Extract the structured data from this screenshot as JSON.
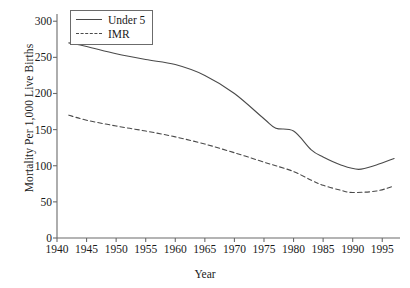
{
  "chart_data": {
    "type": "line",
    "title": "",
    "xlabel": "Year",
    "ylabel": "Mortality Per 1,000 Live Births",
    "xlim": [
      1940,
      1998
    ],
    "ylim": [
      0,
      310
    ],
    "xticks": [
      1940,
      1945,
      1950,
      1955,
      1960,
      1965,
      1970,
      1975,
      1980,
      1985,
      1990,
      1995
    ],
    "yticks": [
      0,
      50,
      100,
      150,
      200,
      250,
      300
    ],
    "grid": false,
    "legend_position": "top-left",
    "series": [
      {
        "name": "Under 5",
        "style": "solid",
        "color": "#4a4a4a",
        "x": [
          1942,
          1945,
          1950,
          1955,
          1960,
          1965,
          1970,
          1975,
          1977,
          1980,
          1983,
          1985,
          1988,
          1991,
          1994,
          1997
        ],
        "values": [
          270,
          265,
          255,
          247,
          240,
          225,
          200,
          165,
          152,
          148,
          122,
          112,
          101,
          95,
          101,
          110
        ]
      },
      {
        "name": "IMR",
        "style": "dashed",
        "color": "#4a4a4a",
        "x": [
          1942,
          1945,
          1950,
          1955,
          1960,
          1965,
          1970,
          1975,
          1977,
          1980,
          1983,
          1985,
          1988,
          1990,
          1994,
          1997
        ],
        "values": [
          170,
          163,
          155,
          148,
          140,
          130,
          118,
          105,
          100,
          92,
          80,
          73,
          66,
          63,
          65,
          72
        ]
      }
    ]
  },
  "legend": {
    "items": [
      {
        "label": "Under 5"
      },
      {
        "label": "IMR"
      }
    ]
  },
  "axis_titles": {
    "x": "Year",
    "y": "Mortality Per 1,000 Live Births"
  }
}
